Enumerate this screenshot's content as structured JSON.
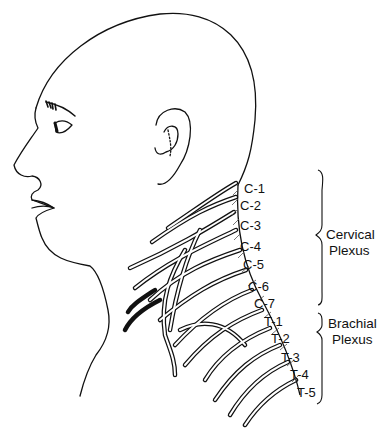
{
  "figure": {
    "colors": {
      "ink": "#111111",
      "background": "#ffffff",
      "hatch": "#555555"
    }
  },
  "labels": {
    "nerves": [
      {
        "text": "C-1",
        "x": 244,
        "y": 182
      },
      {
        "text": "C-2",
        "x": 240,
        "y": 199
      },
      {
        "text": "C-3",
        "x": 240,
        "y": 219
      },
      {
        "text": "C-4",
        "x": 240,
        "y": 240
      },
      {
        "text": "C-5",
        "x": 243,
        "y": 258
      },
      {
        "text": "C-6",
        "x": 248,
        "y": 280
      },
      {
        "text": "C-7",
        "x": 254,
        "y": 297
      },
      {
        "text": "T-1",
        "x": 264,
        "y": 315
      },
      {
        "text": "T-2",
        "x": 271,
        "y": 332
      },
      {
        "text": "T-3",
        "x": 281,
        "y": 351
      },
      {
        "text": "T-4",
        "x": 290,
        "y": 368
      },
      {
        "text": "T-5",
        "x": 297,
        "y": 386
      }
    ],
    "groups": [
      {
        "line1": "Cervical",
        "line2": "Plexus"
      },
      {
        "line1": "Brachial",
        "line2": "Plexus"
      }
    ]
  }
}
